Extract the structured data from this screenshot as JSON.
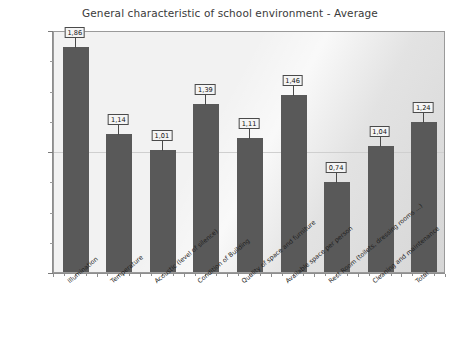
{
  "chart_data": {
    "type": "bar",
    "title": "General characteristic of school environment - Average",
    "xlabel": "",
    "ylabel": "",
    "categories": [
      "Illumination",
      "Temperature",
      "Acoustic (level of silence)",
      "Condition of Building",
      "Quality of space and furniture",
      "Available space per person",
      "Rest Room (toilets, dressing rooms ...)",
      "Cleaning and maintenance",
      "Total"
    ],
    "values": [
      1.86,
      1.14,
      1.01,
      1.39,
      1.11,
      1.46,
      0.74,
      1.04,
      1.24
    ],
    "value_labels": [
      "1,86",
      "1,14",
      "1,01",
      "1,39",
      "1,11",
      "1,46",
      "0,74",
      "1,04",
      "1,24"
    ],
    "ylim": [
      0,
      2
    ],
    "ytick_values": [
      0,
      1,
      2
    ],
    "ytick_labels": [
      "Insufficient",
      "Average",
      "Sufficient"
    ],
    "grid": true,
    "legend": null,
    "bar_color": "#595959",
    "plot_background": "#f2f2f2",
    "frame_color": "#9a9a9a"
  }
}
